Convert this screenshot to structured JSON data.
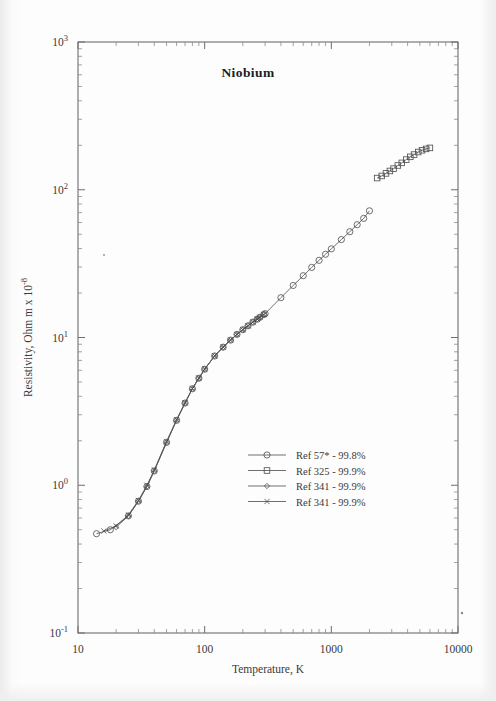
{
  "chart_data": {
    "type": "line",
    "title": "Niobium",
    "xlabel": "Temperature,  K",
    "ylabel": "Resistivity, Ohm m x 10",
    "ylabel_exponent": "-8",
    "xscale": "log",
    "yscale": "log",
    "xlim": [
      10,
      10000
    ],
    "ylim": [
      0.1,
      1000
    ],
    "xticks": [
      "10",
      "100",
      "1000",
      "10000"
    ],
    "yticks": [
      "10",
      "10",
      "10",
      "10",
      "10"
    ],
    "ytick_exponents": [
      "-1",
      "0",
      "1",
      "2",
      "3"
    ],
    "grid": false,
    "legend_position": "center-right",
    "series": [
      {
        "name": "Ref 57* - 99.8%",
        "marker": "circle",
        "x": [
          14,
          18,
          25,
          30,
          35,
          40,
          50,
          60,
          70,
          80,
          90,
          100,
          120,
          140,
          160,
          180,
          200,
          220,
          240,
          260,
          273,
          293,
          300,
          400,
          500,
          600,
          700,
          800,
          900,
          1000,
          1200,
          1400,
          1600,
          1800,
          2000
        ],
        "y": [
          0.47,
          0.5,
          0.62,
          0.78,
          0.98,
          1.25,
          1.95,
          2.75,
          3.6,
          4.5,
          5.3,
          6.1,
          7.5,
          8.6,
          9.6,
          10.5,
          11.3,
          12.0,
          12.7,
          13.3,
          13.7,
          14.3,
          14.5,
          18.6,
          22.5,
          26.2,
          29.8,
          33.3,
          36.6,
          39.8,
          46.0,
          52.0,
          58.0,
          64.0,
          72.0
        ]
      },
      {
        "name": "Ref 325 - 99.9%",
        "marker": "square",
        "x": [
          2300,
          2500,
          2700,
          2900,
          3100,
          3350,
          3600,
          3900,
          4200,
          4500,
          4850,
          5200,
          5600,
          6000
        ],
        "y": [
          120,
          124,
          129,
          134,
          139,
          146,
          152,
          160,
          167,
          173,
          180,
          185,
          189,
          192
        ]
      },
      {
        "name": "Ref 341 - 99.9%",
        "marker": "diamond",
        "x": [
          20,
          25,
          30,
          35,
          40,
          50,
          60,
          70,
          80,
          90,
          100,
          120,
          140,
          160,
          180,
          200,
          220,
          240,
          260,
          273,
          293
        ],
        "y": [
          0.52,
          0.62,
          0.78,
          0.98,
          1.25,
          1.95,
          2.75,
          3.6,
          4.5,
          5.3,
          6.1,
          7.5,
          8.6,
          9.6,
          10.5,
          11.3,
          12.0,
          12.7,
          13.3,
          13.7,
          14.3
        ]
      },
      {
        "name": "Ref 341 - 99.9%",
        "marker": "cross",
        "x": [
          16,
          20,
          25,
          30,
          35,
          40,
          50,
          60,
          70,
          80,
          90,
          100,
          120,
          140,
          160,
          180,
          200,
          220,
          240,
          260,
          273,
          293
        ],
        "y": [
          0.49,
          0.53,
          0.63,
          0.79,
          1.0,
          1.27,
          1.98,
          2.78,
          3.62,
          4.52,
          5.32,
          6.12,
          7.52,
          8.62,
          9.62,
          10.5,
          11.3,
          12.0,
          12.7,
          13.3,
          13.7,
          14.3
        ]
      }
    ]
  }
}
